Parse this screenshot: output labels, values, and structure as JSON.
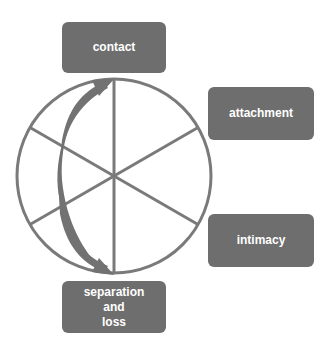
{
  "diagram": {
    "type": "cycle-wheel",
    "colors": {
      "box_fill": "#6e6e6e",
      "box_text": "#ffffff",
      "line": "#7a7a7a",
      "arrow": "#727272",
      "background": "#ffffff"
    },
    "wheel": {
      "center": [
        114,
        176
      ],
      "radius": 97,
      "spokes": 6
    },
    "nodes": [
      {
        "id": "contact",
        "label": "contact"
      },
      {
        "id": "attachment",
        "label": "attachment"
      },
      {
        "id": "intimacy",
        "label": "intimacy"
      },
      {
        "id": "separation",
        "label_lines": [
          "separation",
          "and",
          "loss"
        ]
      }
    ],
    "arrow": {
      "description": "curved double-headed arrow linking separation and loss back to contact",
      "from": "separation",
      "to": "contact"
    }
  }
}
